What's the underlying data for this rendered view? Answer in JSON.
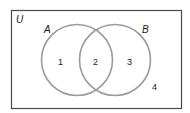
{
  "diagram": {
    "type": "venn",
    "universe_label": "U",
    "sets": [
      {
        "label": "A",
        "region_label": "1"
      },
      {
        "label": "B",
        "region_label": "3"
      }
    ],
    "intersection_label": "2",
    "outside_label": "4",
    "colors": {
      "border": "#4a4a4a",
      "circle": "#9a9a9a",
      "text": "#1a1a1a",
      "background": "#ffffff"
    }
  }
}
